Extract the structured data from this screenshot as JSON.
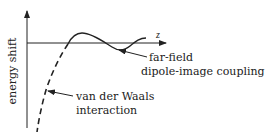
{
  "diagram": {
    "y_axis_label": "energy shift",
    "x_axis_label": "z",
    "annotations": [
      {
        "line1": "far-field",
        "line2": "dipole-image coupling",
        "points_to": "oscillating solid curve"
      },
      {
        "line1": "van der Waals",
        "line2": "interaction",
        "points_to": "dashed curve near surface"
      }
    ],
    "curves": [
      {
        "style": "solid",
        "meaning": "far-field dipole-image coupling (oscillatory)"
      },
      {
        "style": "dashed",
        "meaning": "van der Waals interaction (diverging negative at small z)"
      }
    ],
    "colors": {
      "ink": "#222222",
      "background": "#ffffff"
    }
  }
}
